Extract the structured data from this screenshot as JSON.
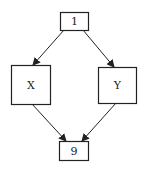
{
  "diagram": {
    "type": "flowchart",
    "stroke_color": "#222222",
    "background": "#ffffff",
    "nodes": [
      {
        "id": "n1",
        "label": "1",
        "x": 60,
        "y": 12,
        "w": 28,
        "h": 18
      },
      {
        "id": "nX",
        "label": "X",
        "x": 11,
        "y": 65,
        "w": 39,
        "h": 39
      },
      {
        "id": "nY",
        "label": "Y",
        "x": 98,
        "y": 67,
        "w": 38,
        "h": 36
      },
      {
        "id": "n9",
        "label": "9",
        "x": 59,
        "y": 141,
        "w": 29,
        "h": 19
      }
    ],
    "edges": [
      {
        "from": "1",
        "to": "X",
        "x1": 64,
        "y1": 30,
        "x2": 33,
        "y2": 65
      },
      {
        "from": "1",
        "to": "Y",
        "x1": 83,
        "y1": 30,
        "x2": 114,
        "y2": 67
      },
      {
        "from": "X",
        "to": "9",
        "x1": 32,
        "y1": 104,
        "x2": 66,
        "y2": 141
      },
      {
        "from": "Y",
        "to": "9",
        "x1": 116,
        "y1": 103,
        "x2": 82,
        "y2": 141
      }
    ]
  }
}
